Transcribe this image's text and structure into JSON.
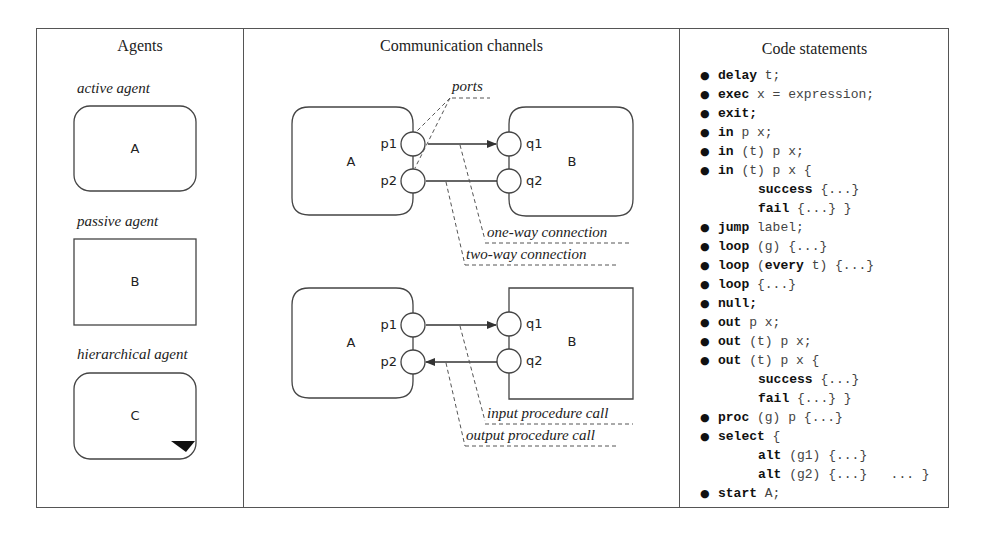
{
  "columns": {
    "agents": {
      "title": "Agents",
      "items": [
        {
          "label": "active agent",
          "box_letter": "A",
          "shape": "rounded"
        },
        {
          "label": "passive agent",
          "box_letter": "B",
          "shape": "rectangle"
        },
        {
          "label": "hierarchical agent",
          "box_letter": "C",
          "shape": "rounded-with-corner-triangle"
        }
      ]
    },
    "channels": {
      "title": "Communication channels",
      "top_diagram": {
        "agent_a": "A",
        "agent_b": "B",
        "ports_a": [
          "p1",
          "p2"
        ],
        "ports_b": [
          "q1",
          "q2"
        ],
        "annotations": {
          "ports": "ports",
          "one_way": "one-way connection",
          "two_way": "two-way connection"
        }
      },
      "bottom_diagram": {
        "agent_a": "A",
        "agent_b": "B",
        "ports_a": [
          "p1",
          "p2"
        ],
        "ports_b": [
          "q1",
          "q2"
        ],
        "annotations": {
          "input_call": "input procedure call",
          "output_call": "output procedure call"
        }
      }
    },
    "code": {
      "title": "Code statements",
      "bullet": "●",
      "lines": [
        {
          "bullet": true,
          "indent": false,
          "kw": "delay",
          "rest": " t;"
        },
        {
          "bullet": true,
          "indent": false,
          "kw": "exec",
          "rest": " x = expression;"
        },
        {
          "bullet": true,
          "indent": false,
          "kw": "exit;",
          "rest": ""
        },
        {
          "bullet": true,
          "indent": false,
          "kw": "in",
          "rest": " p x;"
        },
        {
          "bullet": true,
          "indent": false,
          "kw": "in",
          "rest": " (t) p x;"
        },
        {
          "bullet": true,
          "indent": false,
          "kw": "in",
          "rest": " (t) p x {"
        },
        {
          "bullet": false,
          "indent": true,
          "kw": "success",
          "rest": " {...}"
        },
        {
          "bullet": false,
          "indent": true,
          "kw": "fail",
          "rest": " {...} }"
        },
        {
          "bullet": true,
          "indent": false,
          "kw": "jump",
          "rest": " label;"
        },
        {
          "bullet": true,
          "indent": false,
          "kw": "loop",
          "rest": " (g) {...}"
        },
        {
          "bullet": true,
          "indent": false,
          "kw": "loop",
          "rest": " (",
          "kw2": "every",
          "rest2": " t) {...}"
        },
        {
          "bullet": true,
          "indent": false,
          "kw": "loop",
          "rest": " {...}"
        },
        {
          "bullet": true,
          "indent": false,
          "kw": "null;",
          "rest": ""
        },
        {
          "bullet": true,
          "indent": false,
          "kw": "out",
          "rest": " p x;"
        },
        {
          "bullet": true,
          "indent": false,
          "kw": "out",
          "rest": " (t) p x;"
        },
        {
          "bullet": true,
          "indent": false,
          "kw": "out",
          "rest": " (t) p x {"
        },
        {
          "bullet": false,
          "indent": true,
          "kw": "success",
          "rest": " {...}"
        },
        {
          "bullet": false,
          "indent": true,
          "kw": "fail",
          "rest": " {...} }"
        },
        {
          "bullet": true,
          "indent": false,
          "kw": "proc",
          "rest": " (g) p {...}"
        },
        {
          "bullet": true,
          "indent": false,
          "kw": "select",
          "rest": " {"
        },
        {
          "bullet": false,
          "indent": true,
          "kw": "alt",
          "rest": " (g1) {...}"
        },
        {
          "bullet": false,
          "indent": true,
          "kw": "alt",
          "rest": " (g2) {...}   ... }"
        },
        {
          "bullet": true,
          "indent": false,
          "kw": "start",
          "rest": " A;"
        }
      ]
    }
  },
  "colors": {
    "line": "#444444",
    "border": "#555555",
    "text": "#222222",
    "background": "#ffffff"
  }
}
